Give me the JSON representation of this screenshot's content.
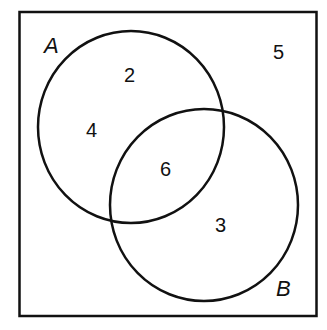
{
  "diagram": {
    "type": "venn",
    "universe_value": "5",
    "sets": [
      {
        "name": "A",
        "only_values": [
          "2",
          "4"
        ]
      },
      {
        "name": "B",
        "only_values": [
          "3"
        ]
      }
    ],
    "intersection_value": "6",
    "labels": {
      "a": "A",
      "b": "B",
      "u": "5",
      "a1": "2",
      "a2": "4",
      "ab": "6",
      "b1": "3"
    },
    "colors": {
      "stroke": "#111111",
      "background": "#ffffff"
    }
  }
}
